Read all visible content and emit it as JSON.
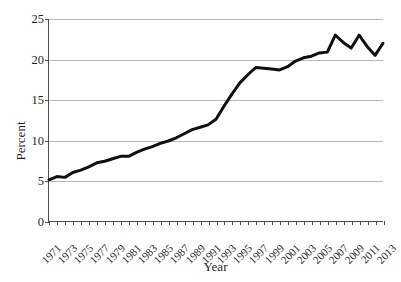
{
  "chart_data": {
    "type": "line",
    "title": "",
    "xlabel": "Year",
    "ylabel": "Percent",
    "xlim": [
      1971,
      2013
    ],
    "ylim": [
      0,
      25
    ],
    "yticks": [
      0,
      5,
      10,
      15,
      20,
      25
    ],
    "ytick_labels": [
      "0",
      "5",
      "10",
      "15",
      "20",
      "25"
    ],
    "grid": "horizontal",
    "legend": "none",
    "line_color": "#101010",
    "line_width": 3,
    "x": [
      1971,
      1972,
      1973,
      1974,
      1975,
      1976,
      1977,
      1978,
      1979,
      1980,
      1981,
      1982,
      1983,
      1984,
      1985,
      1986,
      1987,
      1988,
      1989,
      1990,
      1991,
      1992,
      1993,
      1994,
      1995,
      1996,
      1997,
      1998,
      1999,
      2000,
      2001,
      2002,
      2003,
      2004,
      2005,
      2006,
      2007,
      2008,
      2009,
      2010,
      2011,
      2012,
      2013
    ],
    "xtick_labels": [
      "1971",
      "1973",
      "1975",
      "1977",
      "1979",
      "1981",
      "1983",
      "1985",
      "1987",
      "1989",
      "1991",
      "1993",
      "1995",
      "1997",
      "1999",
      "2001",
      "2003",
      "2005",
      "2007",
      "2009",
      "2011",
      "2013"
    ],
    "values": [
      5.1,
      5.5,
      5.4,
      6.0,
      6.3,
      6.7,
      7.2,
      7.4,
      7.7,
      8.0,
      8.0,
      8.5,
      8.9,
      9.2,
      9.6,
      9.9,
      10.3,
      10.8,
      11.3,
      11.6,
      11.9,
      12.6,
      14.2,
      15.7,
      17.1,
      18.1,
      19.0,
      18.9,
      18.8,
      18.7,
      19.1,
      19.8,
      20.2,
      20.4,
      20.8,
      20.9,
      23.0,
      22.1,
      21.4,
      23.0,
      21.6,
      20.5,
      22.0
    ],
    "series_name": "percent-series"
  }
}
